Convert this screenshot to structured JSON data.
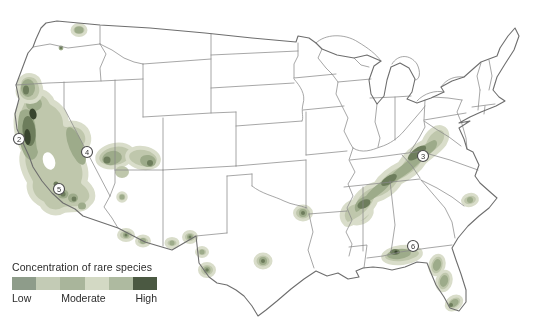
{
  "legend": {
    "title": "Concentration of rare species",
    "scale_labels": [
      "Low",
      "Moderate",
      "High"
    ],
    "swatches": [
      "#8e9c8a",
      "#c3cbb5",
      "#a9b59b",
      "#d3d9c4",
      "#aebaa0",
      "#4b5942"
    ]
  },
  "map": {
    "concentration_colors": {
      "lowest": "#d9ddca",
      "low": "#bfc7ac",
      "moderate": "#9dab8a",
      "high": "#6d7d5c",
      "highest": "#39442e"
    },
    "markers": [
      {
        "label": "2",
        "x": 19,
        "y": 139
      },
      {
        "label": "3",
        "x": 423,
        "y": 156
      },
      {
        "label": "4",
        "x": 87,
        "y": 152
      },
      {
        "label": "5",
        "x": 59,
        "y": 189
      },
      {
        "label": "6",
        "x": 413,
        "y": 246
      }
    ]
  }
}
